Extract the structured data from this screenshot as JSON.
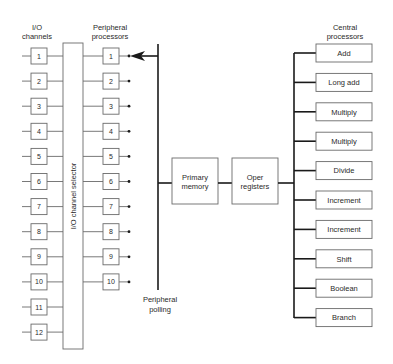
{
  "diagram": {
    "headers": {
      "io_channels": [
        "I/O",
        "channels"
      ],
      "peripheral_processors": [
        "Peripheral",
        "processors"
      ],
      "central_processors": [
        "Central",
        "processors"
      ]
    },
    "io_channels": [
      "1",
      "2",
      "3",
      "4",
      "5",
      "6",
      "7",
      "8",
      "9",
      "10",
      "11",
      "12"
    ],
    "channel_selector_label": "I/O channel selector",
    "peripheral_processors": [
      "1",
      "2",
      "3",
      "4",
      "5",
      "6",
      "7",
      "8",
      "9",
      "10"
    ],
    "peripheral_polling_label": [
      "Peripheral",
      "polling"
    ],
    "primary_memory_label": [
      "Primary",
      "memory"
    ],
    "oper_registers_label": [
      "Oper",
      "registers"
    ],
    "central_processors": [
      "Add",
      "Long add",
      "Multiply",
      "Multiply",
      "Divide",
      "Increment",
      "Increment",
      "Shift",
      "Boolean",
      "Branch"
    ],
    "colors": {
      "line_dark": "#1a1a1a",
      "line_light": "#6a6a6a",
      "text": "#2a2a2a",
      "background": "#ffffff"
    }
  }
}
